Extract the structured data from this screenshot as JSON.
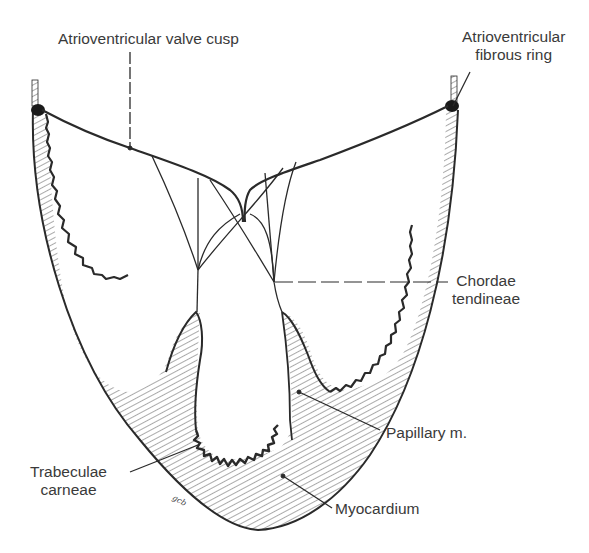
{
  "figure": {
    "colors": {
      "ink": "#2a2a2a",
      "label_text": "#3a3a3a",
      "background": "#ffffff"
    }
  },
  "labels": {
    "valve_cusp": "Atrioventricular valve cusp",
    "fibrous_ring_line1": "Atrioventricular",
    "fibrous_ring_line2": "fibrous ring",
    "chordae_line1": "Chordae",
    "chordae_line2": "tendineae",
    "papillary": "Papillary m.",
    "trabeculae_line1": "Trabeculae",
    "trabeculae_line2": "carneae",
    "myocardium": "Myocardium"
  },
  "signature": "gcb"
}
